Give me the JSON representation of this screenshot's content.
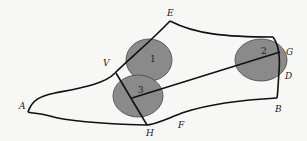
{
  "diagram": {
    "type": "shoe-last pattern",
    "colors": {
      "background": "#f7f7f5",
      "outline": "#111111",
      "circle_fill": "#8a8a8a",
      "circle_stroke": "#444444"
    },
    "points": {
      "A": "A",
      "B": "B",
      "D": "D",
      "E": "E",
      "F": "F",
      "G": "G",
      "H": "H",
      "V": "V"
    },
    "circles": [
      {
        "id": "1",
        "label": "1"
      },
      {
        "id": "2",
        "label": "2"
      },
      {
        "id": "3",
        "label": "3"
      }
    ]
  }
}
